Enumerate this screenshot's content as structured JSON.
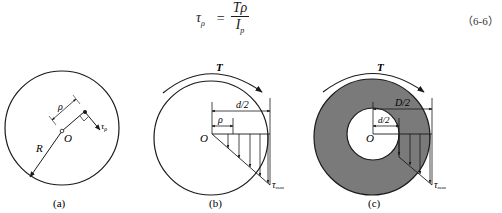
{
  "formula": {
    "lhs_symbol": "τ",
    "lhs_subscript": "ρ",
    "equals": "=",
    "numerator": "Tρ",
    "denominator_symbol": "I",
    "denominator_subscript": "p",
    "equation_number": "（6-6）"
  },
  "figures": [
    {
      "caption": "(a)",
      "labels": {
        "radius_label": "R",
        "center_label": "O",
        "distance_label": "ρ",
        "stress_label": "τ",
        "stress_subscript": "ρ"
      }
    },
    {
      "caption": "(b)",
      "labels": {
        "torque_label": "T",
        "center_label": "O",
        "half_diameter_label": "d/2",
        "distance_label": "ρ",
        "max_stress_label": "τ",
        "max_stress_subscript": "max"
      }
    },
    {
      "caption": "(c)",
      "labels": {
        "torque_label": "T",
        "center_label": "O",
        "outer_half_diameter_label": "D/2",
        "inner_half_diameter_label": "d/2",
        "max_stress_label": "τ",
        "max_stress_subscript": "max"
      }
    }
  ],
  "colors": {
    "line": "#1a1a1a",
    "annulus_fill": "#7a7a7a",
    "background": "#ffffff"
  }
}
